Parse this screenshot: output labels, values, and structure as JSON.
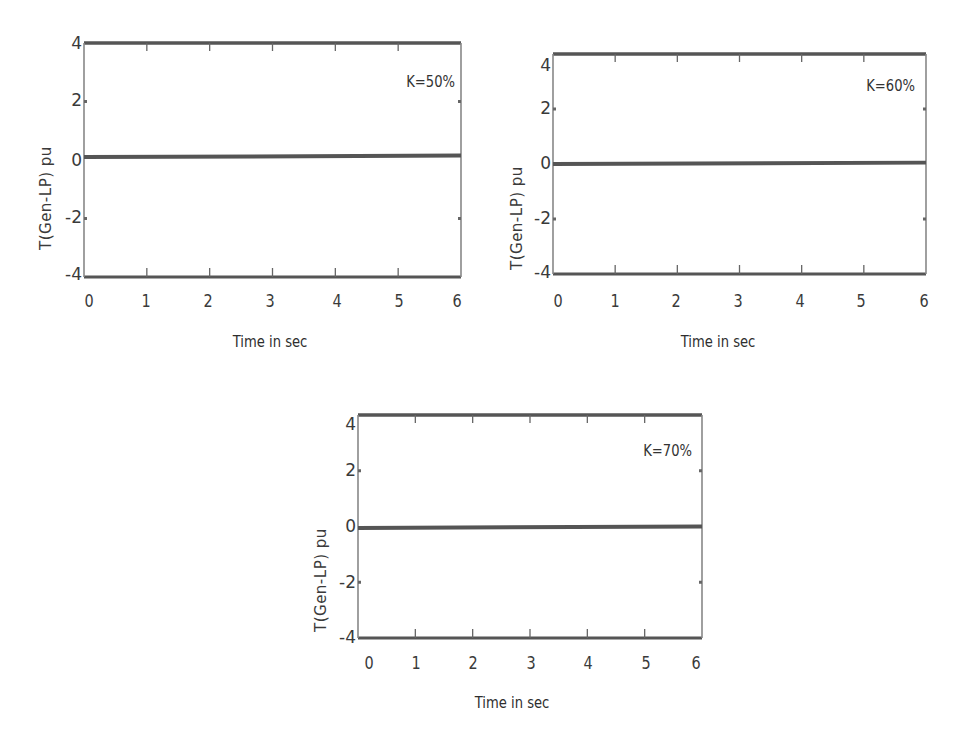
{
  "chart_data": [
    {
      "type": "line",
      "title": "",
      "annotation": "K=50%",
      "xlabel": "Time in sec",
      "ylabel": "T(Gen-LP) pu",
      "xlim": [
        0,
        6
      ],
      "ylim": [
        -4,
        4
      ],
      "xticks": [
        "0",
        "1",
        "2",
        "3",
        "4",
        "5",
        "6"
      ],
      "yticks": [
        "4",
        "2",
        "0",
        "-2",
        "-4"
      ],
      "grid": false,
      "series": [
        {
          "name": "T(Gen-LP)",
          "x": [
            0,
            6
          ],
          "y": [
            0.1,
            0.15
          ],
          "color": "#555555"
        }
      ],
      "box": {
        "left": 84,
        "top": 43,
        "right": 461,
        "bottom": 277
      }
    },
    {
      "type": "line",
      "title": "",
      "annotation": "K=60%",
      "xlabel": "Time in sec",
      "ylabel": "T(Gen-LP) pu",
      "xlim": [
        0,
        6
      ],
      "ylim": [
        -4,
        4
      ],
      "xticks": [
        "0",
        "1",
        "2",
        "3",
        "4",
        "5",
        "6"
      ],
      "yticks": [
        "4",
        "2",
        "0",
        "-2",
        "-4"
      ],
      "grid": false,
      "series": [
        {
          "name": "T(Gen-LP)",
          "x": [
            0,
            6
          ],
          "y": [
            0.0,
            0.05
          ],
          "color": "#555555"
        }
      ],
      "box": {
        "left": 553,
        "top": 54,
        "right": 926,
        "bottom": 274
      }
    },
    {
      "type": "line",
      "title": "",
      "annotation": "K=70%",
      "xlabel": "Time in sec",
      "ylabel": "T(Gen-LP) pu",
      "xlim": [
        0,
        6
      ],
      "ylim": [
        -4,
        4
      ],
      "xticks": [
        "0",
        "1",
        "2",
        "3",
        "4",
        "5",
        "6"
      ],
      "yticks": [
        "4",
        "2",
        "0",
        "-2",
        "-4"
      ],
      "grid": false,
      "series": [
        {
          "name": "T(Gen-LP)",
          "x": [
            0,
            6
          ],
          "y": [
            -0.05,
            0.0
          ],
          "color": "#555555"
        }
      ],
      "box": {
        "left": 358,
        "top": 415,
        "right": 702,
        "bottom": 638
      }
    }
  ],
  "charts": [
    {
      "annotation": "K=50%",
      "xlabel": "Time in sec",
      "ylabel": "T(Gen-LP) pu",
      "xticks": [
        "0",
        "1",
        "2",
        "3",
        "4",
        "5",
        "6"
      ],
      "yticks": [
        "4",
        "2",
        "0",
        "-2",
        "-4"
      ]
    },
    {
      "annotation": "K=60%",
      "xlabel": "Time in sec",
      "ylabel": "T(Gen-LP) pu",
      "xticks": [
        "0",
        "1",
        "2",
        "3",
        "4",
        "5",
        "6"
      ],
      "yticks": [
        "4",
        "2",
        "0",
        "-2",
        "-4"
      ]
    },
    {
      "annotation": "K=70%",
      "xlabel": "Time in sec",
      "ylabel": "T(Gen-LP) pu",
      "xticks": [
        "0",
        "1",
        "2",
        "3",
        "4",
        "5",
        "6"
      ],
      "yticks": [
        "4",
        "2",
        "0",
        "-2",
        "-4"
      ]
    }
  ],
  "colors": {
    "axis": "#555555",
    "line": "#555555",
    "text": "#333333"
  }
}
